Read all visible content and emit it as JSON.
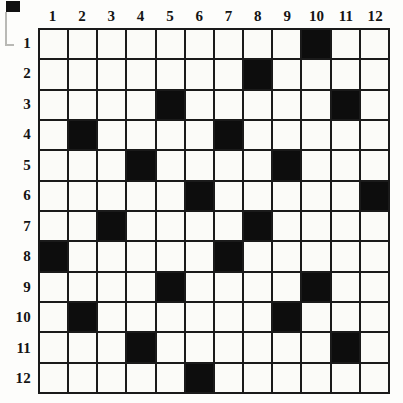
{
  "puzzle": {
    "type": "grid-shading-puzzle",
    "rows": 12,
    "columns": 12,
    "column_labels": [
      "1",
      "2",
      "3",
      "4",
      "5",
      "6",
      "7",
      "8",
      "9",
      "10",
      "11",
      "12"
    ],
    "row_labels": [
      "1",
      "2",
      "3",
      "4",
      "5",
      "6",
      "7",
      "8",
      "9",
      "10",
      "11",
      "12"
    ],
    "colors": {
      "filled_cell": "#0d0d0d",
      "empty_cell": "#fbfbf8",
      "grid_line": "#1a1a1a",
      "label_text": "#141414",
      "page_background": "#fdfdfb"
    },
    "filled_cells_by_row": [
      [
        10
      ],
      [
        8
      ],
      [
        5,
        11
      ],
      [
        2,
        7
      ],
      [
        4,
        9
      ],
      [
        6,
        12
      ],
      [
        3,
        8
      ],
      [
        1,
        7
      ],
      [
        5,
        10
      ],
      [
        2,
        9
      ],
      [
        4,
        11
      ],
      [
        6
      ]
    ],
    "filled_count": 23
  },
  "artifacts": {
    "corner_mark_label": "scan-mark",
    "page_edge_label": "page-edge-line"
  }
}
